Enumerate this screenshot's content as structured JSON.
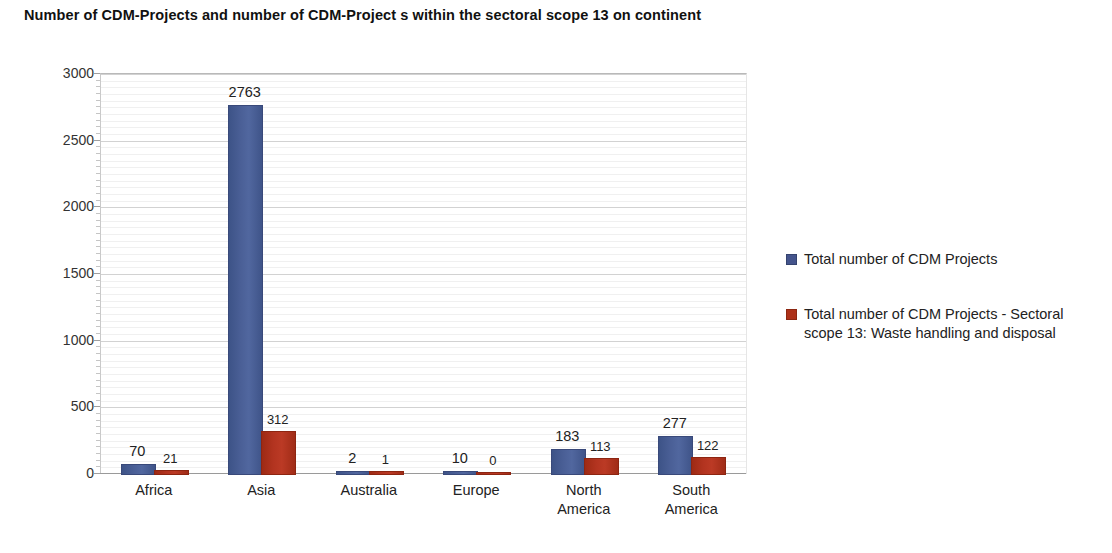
{
  "chart_data": {
    "type": "bar",
    "title": "Number of CDM-Projects and number of  CDM-Project s within the sectoral scope 13 on continent",
    "xlabel": "",
    "ylabel": "",
    "ylim": [
      0,
      3000
    ],
    "y_ticks": [
      0,
      500,
      1000,
      1500,
      2000,
      2500,
      3000
    ],
    "y_tick_labels": [
      "0",
      "500",
      "1000",
      "1500",
      "2000",
      "2500",
      "3000"
    ],
    "minor_tick_step": 50,
    "grid": true,
    "legend_position": "right",
    "categories": [
      "Africa",
      "Asia",
      "Australia",
      "Europe",
      "North America",
      "South America"
    ],
    "category_lines": [
      [
        "Africa"
      ],
      [
        "Asia"
      ],
      [
        "Australia"
      ],
      [
        "Europe"
      ],
      [
        "North",
        "America"
      ],
      [
        "South",
        "America"
      ]
    ],
    "series": [
      {
        "name": "Total number of CDM Projects",
        "color": "#44548c",
        "values": [
          70,
          2763,
          2,
          10,
          183,
          277
        ],
        "labels": [
          "70",
          "2763",
          "2",
          "10",
          "183",
          "277"
        ]
      },
      {
        "name": "Total number of CDM Projects - Sectoral scope 13: Waste handling and disposal",
        "color": "#ad3119",
        "values": [
          21,
          312,
          1,
          0,
          113,
          122
        ],
        "labels": [
          "21",
          "312",
          "1",
          "0",
          "113",
          "122"
        ]
      }
    ]
  },
  "legend": {
    "items": [
      {
        "label": "Total number of CDM Projects",
        "color": "#44548c"
      },
      {
        "label": "Total number of CDM Projects - Sectoral scope 13: Waste handling and disposal",
        "color": "#ad3119"
      }
    ]
  }
}
